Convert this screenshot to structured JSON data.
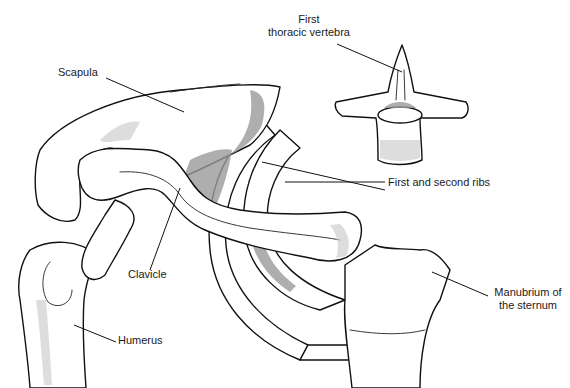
{
  "figure": {
    "type": "anatomical line illustration",
    "colors": {
      "line": "#111111",
      "shading": "#9a9a9a",
      "background": "#ffffff"
    }
  },
  "labels": {
    "first_thoracic_vertebra": {
      "line1": "First",
      "line2": "thoracic vertebra"
    },
    "scapula": "Scapula",
    "ribs": "First and second ribs",
    "clavicle": "Clavicle",
    "manubrium": {
      "line1": "Manubrium of",
      "line2": "the sternum"
    },
    "humerus": "Humerus"
  }
}
